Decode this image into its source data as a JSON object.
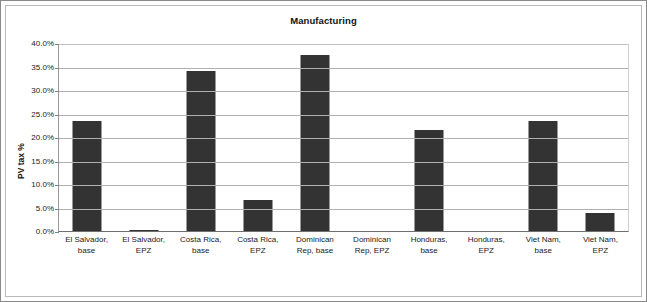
{
  "chart_data": {
    "type": "bar",
    "title": "Manufacturing",
    "xlabel": "",
    "ylabel": "PV tax %",
    "ylim": [
      0,
      40
    ],
    "ytick_labels": [
      "40.0%",
      "35.0%",
      "30.0%",
      "25.0%",
      "20.0%",
      "15.0%",
      "10.0%",
      "5.0%",
      "0.0%"
    ],
    "ytick_values": [
      40,
      35,
      30,
      25,
      20,
      15,
      10,
      5,
      0
    ],
    "grid": "horizontal",
    "legend": "none",
    "bar_color": "#333333",
    "categories": [
      "El Salvador, base",
      "El Salvador, EPZ",
      "Costa Rica, base",
      "Costa Rica, EPZ",
      "Dominican Rep, base",
      "Dominican Rep, EPZ",
      "Honduras, base",
      "Honduras, EPZ",
      "Viet Nam, base",
      "Viet Nam, EPZ"
    ],
    "category_lines": [
      [
        "El Salvador,",
        "base"
      ],
      [
        "El Salvador,",
        "EPZ"
      ],
      [
        "Costa Rica,",
        "base"
      ],
      [
        "Costa Rica,",
        "EPZ"
      ],
      [
        "Dominican",
        "Rep, base"
      ],
      [
        "Dominican",
        "Rep, EPZ"
      ],
      [
        "Honduras,",
        "base"
      ],
      [
        "Honduras,",
        "EPZ"
      ],
      [
        "Viet Nam,",
        "base"
      ],
      [
        "Viet Nam,",
        "EPZ"
      ]
    ],
    "values": [
      23.5,
      0.3,
      34.0,
      6.6,
      37.5,
      0.0,
      21.4,
      0.0,
      23.5,
      3.8
    ]
  }
}
